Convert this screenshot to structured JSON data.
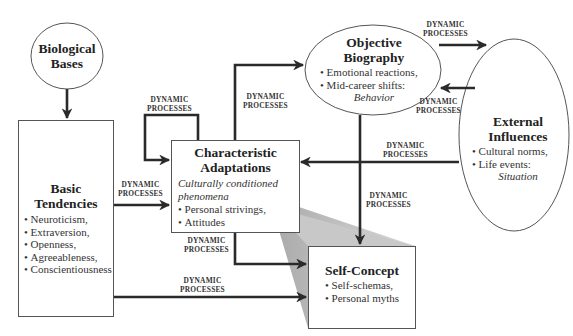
{
  "diagram": {
    "type": "flow-model",
    "edge_label": "DYNAMIC\nPROCESSES",
    "nodes": {
      "biological_bases": {
        "title_line1": "Biological",
        "title_line2": "Bases"
      },
      "basic_tendencies": {
        "title_line1": "Basic",
        "title_line2": "Tendencies",
        "items": [
          "Neuroticism,",
          "Extraversion,",
          "Openness,",
          "Agreeableness,",
          "Conscientiousness"
        ]
      },
      "characteristic_adaptations": {
        "title_line1": "Characteristic",
        "title_line2": "Adaptations",
        "subtitle_line1": "Culturally conditioned",
        "subtitle_line2": "phenomena",
        "items": [
          "Personal strivings,",
          "Attitudes"
        ]
      },
      "objective_biography": {
        "title_line1": "Objective",
        "title_line2": "Biography",
        "items": [
          "Emotional reactions,",
          "Mid-career shifts:"
        ],
        "footer": "Behavior"
      },
      "external_influences": {
        "title_line1": "External",
        "title_line2": "Influences",
        "items": [
          "Cultural norms,",
          "Life events:"
        ],
        "footer": "Situation"
      },
      "self_concept": {
        "title": "Self-Concept",
        "items": [
          "Self-schemas,",
          "Personal myths"
        ]
      }
    },
    "edges": [
      {
        "from": "Biological Bases",
        "to": "Basic Tendencies",
        "label": ""
      },
      {
        "from": "Basic Tendencies",
        "to": "Characteristic Adaptations",
        "label_line1": "DYNAMIC",
        "label_line2": "PROCESSES"
      },
      {
        "from": "Basic Tendencies",
        "to": "Self-Concept",
        "label_line1": "DYNAMIC",
        "label_line2": "PROCESSES"
      },
      {
        "from": "Characteristic Adaptations",
        "to": "Characteristic Adaptations",
        "label_line1": "DYNAMIC",
        "label_line2": "PROCESSES"
      },
      {
        "from": "Characteristic Adaptations",
        "to": "Objective Biography",
        "label_line1": "DYNAMIC",
        "label_line2": "PROCESSES"
      },
      {
        "from": "Characteristic Adaptations",
        "to": "Self-Concept",
        "label_line1": "DYNAMIC",
        "label_line2": "PROCESSES"
      },
      {
        "from": "Objective Biography",
        "to": "External Influences",
        "label_line1": "DYNAMIC",
        "label_line2": "PROCESSES"
      },
      {
        "from": "External Influences",
        "to": "Objective Biography",
        "label_line1": "DYNAMIC",
        "label_line2": "PROCESSES"
      },
      {
        "from": "External Influences",
        "to": "Characteristic Adaptations",
        "label_line1": "DYNAMIC",
        "label_line2": "PROCESSES"
      },
      {
        "from": "Objective Biography",
        "to": "Self-Concept",
        "label_line1": "DYNAMIC",
        "label_line2": "PROCESSES"
      }
    ]
  }
}
